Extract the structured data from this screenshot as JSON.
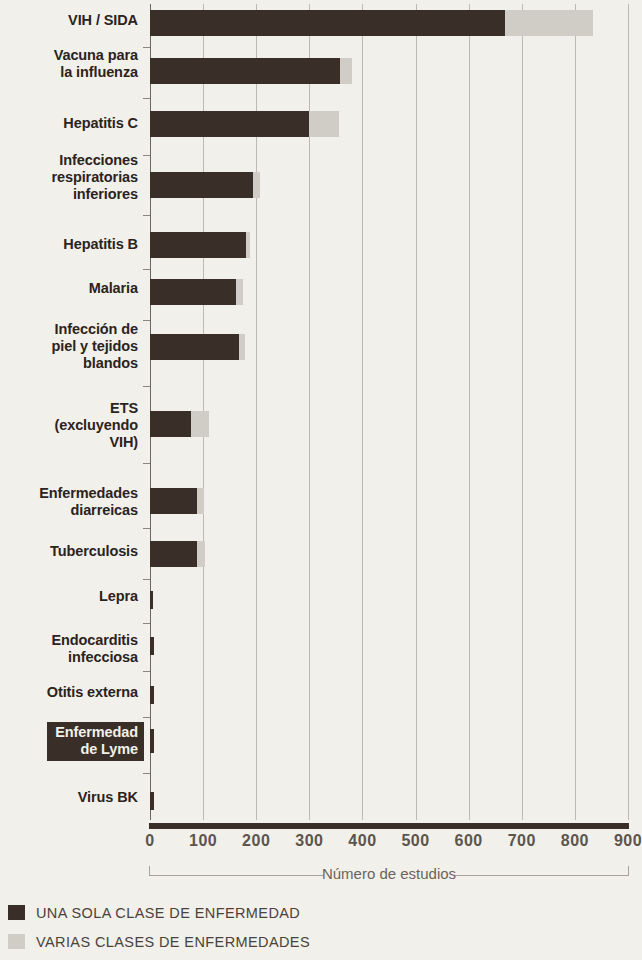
{
  "chart_data": {
    "type": "bar",
    "orientation": "horizontal",
    "stacked": true,
    "title": "",
    "xlabel": "Número de estudios",
    "ylabel": "",
    "xlim": [
      0,
      900
    ],
    "xticks": [
      0,
      100,
      200,
      300,
      400,
      500,
      600,
      700,
      800,
      900
    ],
    "xtick_labels": [
      "0",
      "100",
      "200",
      "300",
      "400",
      "500",
      "600",
      "700",
      "800",
      "900"
    ],
    "grid": "vertical",
    "legend_position": "below-axis-left",
    "categories": [
      "VIH / SIDA",
      "Vacuna para\nla influenza",
      "Hepatitis C",
      "Infecciones\nrespiratorias\ninferiores",
      "Hepatitis B",
      "Malaria",
      "Infección de\npiel y tejidos\nblandos",
      "ETS\n(excluyendo\nVIH)",
      "Enfermedades\ndiarreicas",
      "Tuberculosis",
      "Lepra",
      "Endocarditis\ninfecciosa",
      "Otitis externa",
      "Enfermedad\nde Lyme",
      "Virus BK"
    ],
    "highlighted_category": "Enfermedad\nde Lyme",
    "series": [
      {
        "name": "UNA SOLA CLASE DE ENFERMEDAD",
        "color": "#3a2f28",
        "values": [
          668,
          358,
          300,
          194,
          181,
          162,
          168,
          77,
          88,
          88,
          6,
          8,
          7,
          8,
          7
        ]
      },
      {
        "name": "VARIAS CLASES DE ENFERMEDADES",
        "color": "#cfcdc6",
        "values": [
          166,
          22,
          56,
          13,
          7,
          13,
          11,
          34,
          14,
          16,
          0,
          0,
          0,
          0,
          0
        ]
      }
    ]
  },
  "legend": {
    "items": [
      {
        "label": "UNA SOLA CLASE DE ENFERMEDAD",
        "color": "#3a2f28"
      },
      {
        "label": "VARIAS CLASES DE ENFERMEDADES",
        "color": "#cfcdc6"
      }
    ]
  },
  "colors": {
    "background": "#f2f0ea",
    "dark_series": "#3a2f28",
    "light_series": "#cfcdc6",
    "gridline": "#bdb9b0",
    "axis": "#3a2f28",
    "label_text": "#2b231d",
    "tick_text": "#5c554d",
    "axis_title_text": "#6b645c"
  }
}
